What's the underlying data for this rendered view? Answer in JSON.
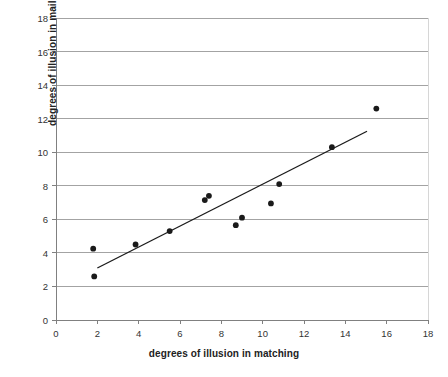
{
  "chart_data": {
    "type": "scatter",
    "title": "",
    "xlabel": "degrees of illusion in matching",
    "ylabel": "degrees of illusion in mailing",
    "xlim": [
      0,
      18
    ],
    "ylim": [
      0,
      18
    ],
    "xticks": [
      0,
      2,
      4,
      6,
      8,
      10,
      12,
      14,
      16,
      18
    ],
    "yticks": [
      0,
      2,
      4,
      6,
      8,
      10,
      12,
      14,
      16,
      18
    ],
    "xtick_labels": [
      "0",
      "2",
      "4",
      "6",
      "8",
      "10",
      "12",
      "14",
      "16",
      "18"
    ],
    "ytick_labels": [
      "0",
      "2",
      "4",
      "6",
      "8",
      "10",
      "12",
      "14",
      "16",
      "18"
    ],
    "grid": "horizontal",
    "legend": "none",
    "marker_color": "#1a1a1a",
    "trendline_color": "#1a1a1a",
    "grid_color": "#999999",
    "axis_color": "#808080",
    "points": [
      {
        "x": 1.8,
        "y": 4.25
      },
      {
        "x": 1.85,
        "y": 2.6
      },
      {
        "x": 3.85,
        "y": 4.5
      },
      {
        "x": 5.5,
        "y": 5.3
      },
      {
        "x": 7.2,
        "y": 7.15
      },
      {
        "x": 7.4,
        "y": 7.4
      },
      {
        "x": 8.7,
        "y": 5.65
      },
      {
        "x": 9.0,
        "y": 6.1
      },
      {
        "x": 10.4,
        "y": 6.95
      },
      {
        "x": 10.8,
        "y": 8.1
      },
      {
        "x": 13.35,
        "y": 10.3
      },
      {
        "x": 15.5,
        "y": 12.6
      }
    ],
    "trendline": {
      "x0": 2.0,
      "y0": 3.1,
      "x1": 15.05,
      "y1": 11.25
    }
  }
}
